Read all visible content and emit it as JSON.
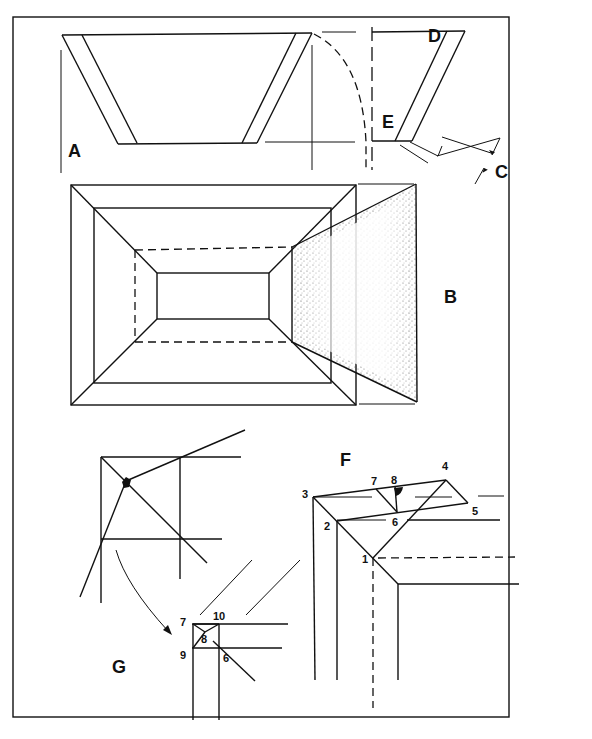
{
  "figure": {
    "labels": {
      "A": "A",
      "B": "B",
      "C": "C",
      "D": "D",
      "E": "E",
      "F": "F",
      "G": "G"
    },
    "detail_f_points": [
      "1",
      "2",
      "3",
      "4",
      "5",
      "6",
      "7",
      "8"
    ],
    "detail_g_points": [
      "7",
      "8",
      "9",
      "10",
      "6"
    ],
    "colors": {
      "ink": "#111111",
      "paper": "#ffffff",
      "stipple": "#555555"
    }
  }
}
